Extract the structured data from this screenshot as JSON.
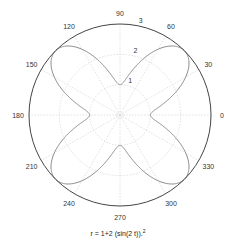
{
  "chart_data": {
    "type": "line",
    "subtype": "polar",
    "title_parts": {
      "base": "r = 1+2 (sin(2 t)).",
      "sup": "2"
    },
    "angular_ticks": [
      "0",
      "30",
      "60",
      "90",
      "120",
      "150",
      "180",
      "210",
      "240",
      "270",
      "300",
      "330"
    ],
    "radial_ticks": [
      "1",
      "2",
      "3"
    ],
    "rlim": [
      0,
      3
    ],
    "grid": true,
    "series": [
      {
        "name": "r = 1+2 sin(2t)^2",
        "function": "1+2*sin(2*t)^2",
        "t_range": [
          0,
          6.2832
        ],
        "samples": [
          {
            "theta_deg": 0,
            "r": 1
          },
          {
            "theta_deg": 15,
            "r": 1.5
          },
          {
            "theta_deg": 30,
            "r": 2.5
          },
          {
            "theta_deg": 45,
            "r": 3
          },
          {
            "theta_deg": 60,
            "r": 2.5
          },
          {
            "theta_deg": 75,
            "r": 1.5
          },
          {
            "theta_deg": 90,
            "r": 1
          },
          {
            "theta_deg": 135,
            "r": 3
          },
          {
            "theta_deg": 180,
            "r": 1
          },
          {
            "theta_deg": 225,
            "r": 3
          },
          {
            "theta_deg": 270,
            "r": 1
          },
          {
            "theta_deg": 315,
            "r": 3
          }
        ]
      }
    ]
  },
  "layout": {
    "cx": 120,
    "cy": 115,
    "R": 91,
    "colors": {
      "curve": "#8c8c8c",
      "axis": "#444444",
      "grid": "#d8d8d8"
    }
  }
}
